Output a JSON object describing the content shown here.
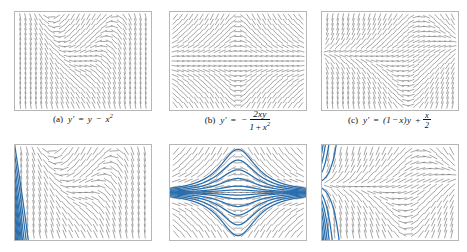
{
  "figure": {
    "background": "#ffffff",
    "width": 467,
    "height": 252,
    "rows": 2,
    "columns": 3,
    "field_color": "#5d5d5d",
    "curve_color": "#2a6ead",
    "border_color": "#b6b6b6"
  },
  "captions": [
    {
      "key": "a",
      "label": "(a)",
      "equation_text": "y' = y − x²",
      "lhs": "y",
      "prime": "′",
      "equals": "=",
      "rhs_parts": [
        "y",
        "−",
        "x",
        "2"
      ]
    },
    {
      "key": "b",
      "label": "(b)",
      "equation_text": "y' = − 2xy / (1 + x²)",
      "lhs": "y",
      "prime": "′",
      "equals": "=",
      "sign": "−",
      "numerator": "2xy",
      "denominator_parts": [
        "1",
        "+",
        "x",
        "2"
      ]
    },
    {
      "key": "c",
      "label": "(c)",
      "equation_text": "y' = (1 − x)y + x/2",
      "lhs": "y",
      "prime": "′",
      "equals": "=",
      "open": "(",
      "one": "1",
      "minus": "−",
      "x": "x",
      "close": ")",
      "y": "y",
      "plus": "+",
      "frac_num": "x",
      "frac_den": "2"
    }
  ],
  "panels": [
    {
      "id": "field-a",
      "name": "direction-field-a",
      "row": "top",
      "column": 1,
      "ode": "y - x*x",
      "xmin": -3,
      "xmax": 3,
      "ymin": -2.2,
      "ymax": 2.2,
      "nx": 25,
      "ny": 19,
      "show_curves": false,
      "left": 14,
      "top": 11,
      "width": 138,
      "height": 100
    },
    {
      "id": "field-b",
      "name": "direction-field-b",
      "row": "top",
      "column": 2,
      "ode": "-2*x*y/(1+x*x)",
      "xmin": -3,
      "xmax": 3,
      "ymin": -2.2,
      "ymax": 2.2,
      "nx": 25,
      "ny": 19,
      "show_curves": false,
      "left": 169,
      "top": 11,
      "width": 138,
      "height": 100
    },
    {
      "id": "field-c",
      "name": "direction-field-c",
      "row": "top",
      "column": 3,
      "ode": "(1-x)*y + x/2",
      "xmin": -3,
      "xmax": 3,
      "ymin": -2.2,
      "ymax": 2.2,
      "nx": 25,
      "ny": 19,
      "show_curves": false,
      "left": 321,
      "top": 11,
      "width": 138,
      "height": 100
    },
    {
      "id": "curves-a",
      "name": "integral-curves-a",
      "row": "bottom",
      "column": 1,
      "ode": "y - x*x",
      "xmin": -3,
      "xmax": 3,
      "ymin": -2.2,
      "ymax": 2.2,
      "nx": 21,
      "ny": 15,
      "show_curves": true,
      "seeds_y": [
        -1.9,
        -1.5,
        -1.1,
        -0.75,
        -0.4,
        -0.05,
        0.3,
        0.7,
        1.15,
        1.65,
        2.1
      ],
      "seed_x": -3,
      "left": 14,
      "top": 144,
      "width": 138,
      "height": 97
    },
    {
      "id": "curves-b",
      "name": "integral-curves-b",
      "row": "bottom",
      "column": 2,
      "ode": "-2*x*y/(1+x*x)",
      "xmin": -3,
      "xmax": 3,
      "ymin": -2.2,
      "ymax": 2.2,
      "nx": 21,
      "ny": 15,
      "show_curves": true,
      "seeds_y": [
        -2.0,
        -1.5,
        -1.05,
        -0.65,
        -0.3,
        -0.12,
        0.12,
        0.3,
        0.65,
        1.05,
        1.5,
        2.0
      ],
      "seed_x": 0,
      "left": 169,
      "top": 144,
      "width": 138,
      "height": 97
    },
    {
      "id": "curves-c",
      "name": "integral-curves-c",
      "row": "bottom",
      "column": 3,
      "ode": "(1-x)*y + x/2",
      "xmin": -3,
      "xmax": 3,
      "ymin": -2.2,
      "ymax": 2.2,
      "nx": 21,
      "ny": 15,
      "show_curves": true,
      "seeds_y": [
        -2.0,
        -1.5,
        -1.05,
        -0.7,
        -0.4,
        -0.1,
        0.2,
        0.55,
        0.95,
        1.4,
        1.9
      ],
      "seed_x": -3,
      "left": 321,
      "top": 144,
      "width": 138,
      "height": 97
    }
  ],
  "caption_boxes": [
    {
      "left": 14,
      "top": 113,
      "width": 138
    },
    {
      "left": 169,
      "top": 110,
      "width": 138
    },
    {
      "left": 321,
      "top": 111,
      "width": 138
    }
  ],
  "chart_data": {
    "type": "line",
    "xlabel": "x",
    "ylabel": "y",
    "xlim": [
      -3,
      3
    ],
    "ylim": [
      -2.2,
      2.2
    ],
    "grid": false,
    "legend": "none",
    "series": [
      {
        "name": "(a) y' = y - x^2",
        "equation": "y' = y − x²",
        "general_solution": "y = x^2 + 2x + 2 + C e^x",
        "panels": [
          "field-a",
          "curves-a"
        ]
      },
      {
        "name": "(b) y' = -2xy/(1+x^2)",
        "equation": "y' = − 2xy/(1 + x²)",
        "general_solution": "y = C/(1 + x^2)",
        "panels": [
          "field-b",
          "curves-b"
        ]
      },
      {
        "name": "(c) y' = (1-x)y + x/2",
        "equation": "y' = (1 − x)y + x/2",
        "general_solution": "numerically integrated",
        "panels": [
          "field-c",
          "curves-c"
        ]
      }
    ]
  }
}
